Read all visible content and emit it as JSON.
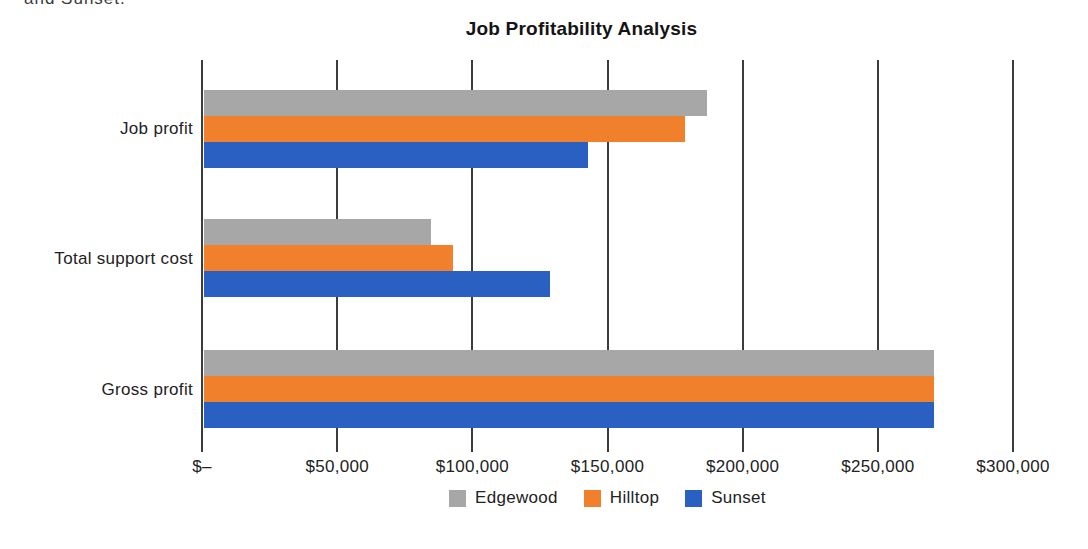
{
  "page": {
    "clipped_text": "and Sunset.",
    "background": "#ffffff"
  },
  "chart_data": {
    "type": "bar",
    "orientation": "horizontal",
    "title": "Job Profitability Analysis",
    "categories": [
      "Job profit",
      "Total support cost",
      "Gross profit"
    ],
    "series": [
      {
        "name": "Edgewood",
        "color": "#A7A7A7",
        "values": [
          186000,
          84000,
          270000
        ]
      },
      {
        "name": "Hilltop",
        "color": "#F0802C",
        "values": [
          178000,
          92000,
          270000
        ]
      },
      {
        "name": "Sunset",
        "color": "#2B60C3",
        "values": [
          142000,
          128000,
          270000
        ]
      }
    ],
    "x_axis": {
      "min": 0,
      "max": 300000,
      "tick_interval": 50000,
      "tick_labels": [
        "$–",
        "$50,000",
        "$100,000",
        "$150,000",
        "$200,000",
        "$250,000",
        "$300,000"
      ]
    },
    "xlabel": "",
    "ylabel": "",
    "grid": true,
    "gridline_color": "#3c3c3c",
    "legend_position": "bottom"
  }
}
